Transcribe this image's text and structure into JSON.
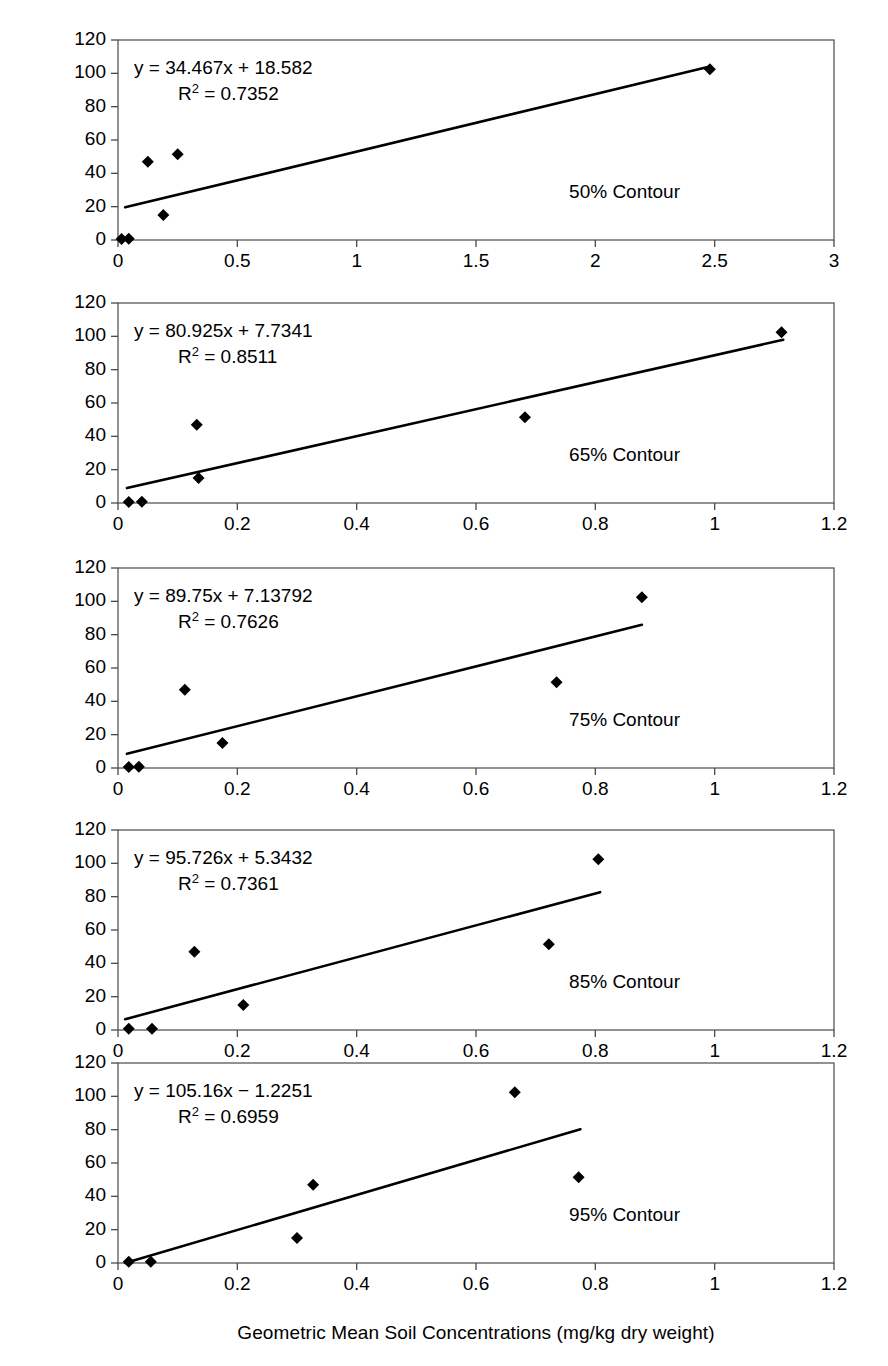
{
  "figure": {
    "y_axis_label": "Dieldrin Plasma Concentrations (µg/mL)",
    "x_axis_label": "Geometric Mean Soil Concentrations (mg/kg dry weight)"
  },
  "chart_data": [
    {
      "type": "scatter",
      "panel_index": 0,
      "annotation": "50% Contour",
      "equation": "y = 34.467x + 18.582",
      "r_squared_label": "R",
      "r_squared_sup": "2",
      "r_squared_value": "= 0.7352",
      "slope": 34.467,
      "intercept": 18.582,
      "r2": 0.7352,
      "xlabel": "Geometric Mean Soil Concentrations (mg/kg dry weight)",
      "ylabel": "Dieldrin Plasma Concentrations (µg/mL)",
      "xlim": [
        0,
        3
      ],
      "ylim": [
        0,
        120
      ],
      "xticks": [
        0,
        0.5,
        1,
        1.5,
        2,
        2.5,
        3
      ],
      "xticklabels": [
        "0",
        "0.5",
        "1",
        "1.5",
        "2",
        "2.5",
        "3"
      ],
      "yticks": [
        0,
        20,
        40,
        60,
        80,
        100,
        120
      ],
      "yticklabels": [
        "0",
        "20",
        "40",
        "60",
        "80",
        "100",
        "120"
      ],
      "grid": false,
      "fit_x_range": [
        0.03,
        2.48
      ],
      "points": [
        {
          "x": 0.015,
          "y": 0.6
        },
        {
          "x": 0.045,
          "y": 0.8
        },
        {
          "x": 0.125,
          "y": 47
        },
        {
          "x": 0.19,
          "y": 15
        },
        {
          "x": 0.25,
          "y": 51.5
        },
        {
          "x": 2.48,
          "y": 102.5
        }
      ]
    },
    {
      "type": "scatter",
      "panel_index": 1,
      "annotation": "65% Contour",
      "equation": "y = 80.925x + 7.7341",
      "r_squared_label": "R",
      "r_squared_sup": "2",
      "r_squared_value": "= 0.8511",
      "slope": 80.925,
      "intercept": 7.7341,
      "r2": 0.8511,
      "xlim": [
        0,
        1.2
      ],
      "ylim": [
        0,
        120
      ],
      "xticks": [
        0,
        0.2,
        0.4,
        0.6,
        0.8,
        1,
        1.2
      ],
      "xticklabels": [
        "0",
        "0.2",
        "0.4",
        "0.6",
        "0.8",
        "1",
        "1.2"
      ],
      "yticks": [
        0,
        20,
        40,
        60,
        80,
        100,
        120
      ],
      "yticklabels": [
        "0",
        "20",
        "40",
        "60",
        "80",
        "100",
        "120"
      ],
      "grid": false,
      "fit_x_range": [
        0.015,
        1.115
      ],
      "points": [
        {
          "x": 0.018,
          "y": 0.6
        },
        {
          "x": 0.04,
          "y": 0.8
        },
        {
          "x": 0.132,
          "y": 47
        },
        {
          "x": 0.135,
          "y": 15
        },
        {
          "x": 0.682,
          "y": 51.5
        },
        {
          "x": 1.112,
          "y": 102.5
        }
      ]
    },
    {
      "type": "scatter",
      "panel_index": 2,
      "annotation": "75% Contour",
      "equation": "y = 89.75x + 7.13792",
      "r_squared_label": "R",
      "r_squared_sup": "2",
      "r_squared_value": "= 0.7626",
      "slope": 89.75,
      "intercept": 7.13792,
      "r2": 0.7626,
      "xlim": [
        0,
        1.2
      ],
      "ylim": [
        0,
        120
      ],
      "xticks": [
        0,
        0.2,
        0.4,
        0.6,
        0.8,
        1,
        1.2
      ],
      "xticklabels": [
        "0",
        "0.2",
        "0.4",
        "0.6",
        "0.8",
        "1",
        "1.2"
      ],
      "yticks": [
        0,
        20,
        40,
        60,
        80,
        100,
        120
      ],
      "yticklabels": [
        "0",
        "20",
        "40",
        "60",
        "80",
        "100",
        "120"
      ],
      "grid": false,
      "fit_x_range": [
        0.015,
        0.878
      ],
      "points": [
        {
          "x": 0.018,
          "y": 0.6
        },
        {
          "x": 0.035,
          "y": 0.8
        },
        {
          "x": 0.112,
          "y": 47
        },
        {
          "x": 0.175,
          "y": 15
        },
        {
          "x": 0.735,
          "y": 51.5
        },
        {
          "x": 0.878,
          "y": 102.5
        }
      ]
    },
    {
      "type": "scatter",
      "panel_index": 3,
      "annotation": "85% Contour",
      "equation": "y = 95.726x + 5.3432",
      "r_squared_label": "R",
      "r_squared_sup": "2",
      "r_squared_value": "= 0.7361",
      "slope": 95.726,
      "intercept": 5.3432,
      "r2": 0.7361,
      "xlim": [
        0,
        1.2
      ],
      "ylim": [
        0,
        120
      ],
      "xticks": [
        0,
        0.2,
        0.4,
        0.6,
        0.8,
        1,
        1.2
      ],
      "xticklabels": [
        "0",
        "0.2",
        "0.4",
        "0.6",
        "0.8",
        "1",
        "1.2"
      ],
      "yticks": [
        0,
        20,
        40,
        60,
        80,
        100,
        120
      ],
      "yticklabels": [
        "0",
        "20",
        "40",
        "60",
        "80",
        "100",
        "120"
      ],
      "grid": false,
      "fit_x_range": [
        0.012,
        0.808
      ],
      "points": [
        {
          "x": 0.018,
          "y": 0.8
        },
        {
          "x": 0.057,
          "y": 0.8
        },
        {
          "x": 0.128,
          "y": 47
        },
        {
          "x": 0.21,
          "y": 15
        },
        {
          "x": 0.722,
          "y": 51.5
        },
        {
          "x": 0.805,
          "y": 102.5
        }
      ]
    },
    {
      "type": "scatter",
      "panel_index": 4,
      "annotation": "95% Contour",
      "equation": "y = 105.16x − 1.2251",
      "r_squared_label": "R",
      "r_squared_sup": "2",
      "r_squared_value": "= 0.6959",
      "slope": 105.16,
      "intercept": -1.2251,
      "r2": 0.6959,
      "xlim": [
        0,
        1.2
      ],
      "ylim": [
        0,
        120
      ],
      "xticks": [
        0,
        0.2,
        0.4,
        0.6,
        0.8,
        1,
        1.2
      ],
      "xticklabels": [
        "0",
        "0.2",
        "0.4",
        "0.6",
        "0.8",
        "1",
        "1.2"
      ],
      "yticks": [
        0,
        20,
        40,
        60,
        80,
        100,
        120
      ],
      "yticklabels": [
        "0",
        "20",
        "40",
        "60",
        "80",
        "100",
        "120"
      ],
      "grid": false,
      "fit_x_range": [
        0.012,
        0.775
      ],
      "points": [
        {
          "x": 0.018,
          "y": 0.8
        },
        {
          "x": 0.055,
          "y": 0.8
        },
        {
          "x": 0.3,
          "y": 15
        },
        {
          "x": 0.327,
          "y": 47
        },
        {
          "x": 0.665,
          "y": 102.5
        },
        {
          "x": 0.772,
          "y": 51.5
        }
      ]
    }
  ]
}
